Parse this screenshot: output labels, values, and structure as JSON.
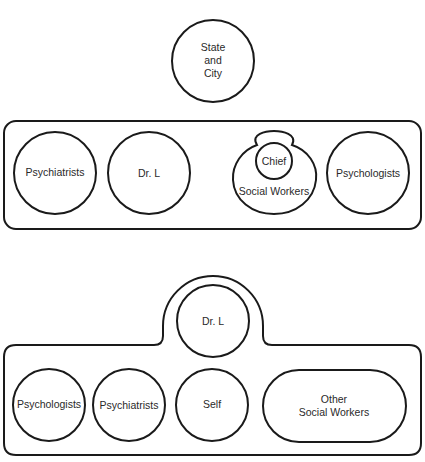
{
  "diagram": {
    "top": {
      "outside_node": {
        "lines": [
          "State",
          "and",
          "City"
        ]
      },
      "group_nodes": {
        "psychiatrists": "Psychiatrists",
        "dr_l": "Dr. L",
        "chief": "Chief",
        "social_workers": "Social Workers",
        "psychologists": "Psychologists"
      }
    },
    "bottom": {
      "bump_node": "Dr. L",
      "group_nodes": {
        "psychologists": "Psychologists",
        "psychiatrists": "Psychiatrists",
        "self": "Self",
        "other_social_workers": [
          "Other",
          "Social Workers"
        ]
      }
    }
  },
  "colors": {
    "stroke": "#1a1a1a",
    "text": "#2a2a2a",
    "background": "#ffffff"
  }
}
